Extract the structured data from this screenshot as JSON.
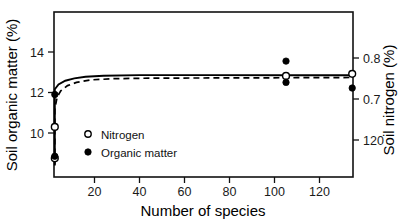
{
  "chart_data": {
    "type": "scatter",
    "title": "",
    "xlabel": "Number of species",
    "ylabel": "Soil organic matter (%)",
    "y2label": "Soil nitrogen (%)",
    "xlim": [
      0,
      142
    ],
    "ylim": [
      8.2,
      15.2
    ],
    "y2lim": [
      0.64,
      0.85
    ],
    "grid": false,
    "legend_position": "inner-left",
    "xticks": [
      20,
      40,
      60,
      80,
      100,
      120
    ],
    "xtick_labels": [
      "20",
      "40",
      "60",
      "80",
      "100",
      "120"
    ],
    "yticks": [
      10,
      12,
      14
    ],
    "ytick_labels": [
      "10",
      "12",
      "14"
    ],
    "y2ticks": [
      0.7,
      0.75,
      0.8
    ],
    "y2tick_labels": [
      "120",
      "0.7",
      "0.8"
    ],
    "series": [
      {
        "name": "Nitrogen",
        "marker": "open-circle",
        "axis": "right",
        "points": [
          {
            "x": 1,
            "y": 10.3
          },
          {
            "x": 1,
            "y": 8.75
          },
          {
            "x": 105,
            "y": 12.82
          },
          {
            "x": 135,
            "y": 12.92
          }
        ]
      },
      {
        "name": "Organic matter",
        "marker": "filled-circle",
        "axis": "left",
        "points": [
          {
            "x": 1,
            "y": 11.9
          },
          {
            "x": 1,
            "y": 8.85
          },
          {
            "x": 105,
            "y": 13.55
          },
          {
            "x": 105,
            "y": 12.5
          },
          {
            "x": 135,
            "y": 12.22
          }
        ]
      }
    ],
    "fit_curves": [
      {
        "name": "organic-matter-fit",
        "style": "solid",
        "plateau": 12.85,
        "points": [
          {
            "x": 0.6,
            "y": 8.4
          },
          {
            "x": 1.0,
            "y": 11.9
          },
          {
            "x": 2.0,
            "y": 12.16
          },
          {
            "x": 4.0,
            "y": 12.4
          },
          {
            "x": 7.0,
            "y": 12.58
          },
          {
            "x": 11.0,
            "y": 12.7
          },
          {
            "x": 16.0,
            "y": 12.78
          },
          {
            "x": 24.0,
            "y": 12.83
          },
          {
            "x": 40.0,
            "y": 12.86
          },
          {
            "x": 70.0,
            "y": 12.86
          },
          {
            "x": 105.0,
            "y": 12.85
          },
          {
            "x": 141.0,
            "y": 12.85
          }
        ]
      },
      {
        "name": "nitrogen-fit",
        "style": "dashed",
        "plateau": 12.72,
        "points": [
          {
            "x": 0.8,
            "y": 8.45
          },
          {
            "x": 1.4,
            "y": 10.1
          },
          {
            "x": 2.2,
            "y": 11.2
          },
          {
            "x": 3.4,
            "y": 11.78
          },
          {
            "x": 5.0,
            "y": 12.08
          },
          {
            "x": 8.0,
            "y": 12.34
          },
          {
            "x": 12.0,
            "y": 12.5
          },
          {
            "x": 18.0,
            "y": 12.62
          },
          {
            "x": 28.0,
            "y": 12.68
          },
          {
            "x": 45.0,
            "y": 12.71
          },
          {
            "x": 80.0,
            "y": 12.72
          },
          {
            "x": 110.0,
            "y": 12.73
          },
          {
            "x": 141.0,
            "y": 12.74
          }
        ]
      }
    ],
    "legend": [
      {
        "label": "Nitrogen",
        "marker": "open-circle"
      },
      {
        "label": "Organic matter",
        "marker": "filled-circle"
      }
    ]
  }
}
